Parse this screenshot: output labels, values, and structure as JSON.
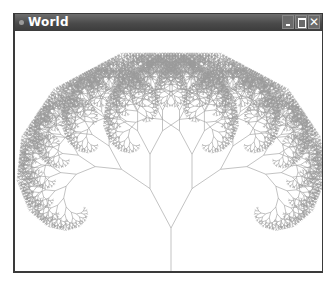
{
  "window": {
    "title": "World",
    "buttons": {
      "minimize": "minimize",
      "maximize": "maximize",
      "close": "✕"
    }
  },
  "canvas": {
    "background": "#ffffff",
    "stroke_color": "#9a9a9a",
    "tree": {
      "type": "fractal-binary-tree",
      "base_x": 156,
      "base_y": 255,
      "trunk_length": 58,
      "length_ratio": 0.77,
      "branch_angle_deg": 28,
      "depth": 13
    }
  }
}
